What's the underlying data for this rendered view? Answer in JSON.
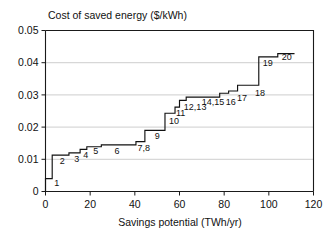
{
  "chart_data": {
    "type": "line",
    "subtype": "step-supply-curve",
    "title": "Cost of saved energy ($/kWh)",
    "xlabel": "Savings potential (TWh/yr)",
    "ylabel": "Cost of saved energy ($/kWh)",
    "xlim": [
      0,
      120
    ],
    "ylim": [
      0,
      0.05
    ],
    "xticks": [
      0,
      20,
      40,
      60,
      80,
      100,
      120
    ],
    "xtick_labels": [
      "0",
      "20",
      "40",
      "60",
      "80",
      "100",
      "120"
    ],
    "yticks": [
      0,
      0.01,
      0.02,
      0.03,
      0.04,
      0.05
    ],
    "ytick_labels": [
      "0",
      "0.01",
      "0.02",
      "0.03",
      "0.04",
      "0.05"
    ],
    "grid": "horizontal",
    "legend": "none",
    "note": "Cumulative step (supply) curve: each measure adds width on x and sits at its cost on y",
    "steps": [
      {
        "label": "1",
        "x_start": 0.0,
        "x_end": 3.0,
        "cost": 0.004
      },
      {
        "label": "2",
        "x_start": 3.0,
        "x_end": 10.5,
        "cost": 0.0113
      },
      {
        "label": "3",
        "x_start": 10.5,
        "x_end": 15.5,
        "cost": 0.012
      },
      {
        "label": "4",
        "x_start": 15.5,
        "x_end": 18.5,
        "cost": 0.0131
      },
      {
        "label": "5",
        "x_start": 18.5,
        "x_end": 25.0,
        "cost": 0.0139
      },
      {
        "label": "6",
        "x_start": 25.0,
        "x_end": 40.5,
        "cost": 0.0145
      },
      {
        "label": "7,8",
        "x_start": 40.5,
        "x_end": 44.5,
        "cost": 0.0155
      },
      {
        "label": "9",
        "x_start": 44.5,
        "x_end": 53.5,
        "cost": 0.019
      },
      {
        "label": "10",
        "x_start": 53.5,
        "x_end": 58.0,
        "cost": 0.0243
      },
      {
        "label": "11",
        "x_start": 58.0,
        "x_end": 60.0,
        "cost": 0.0262
      },
      {
        "label": "12,13",
        "x_start": 60.0,
        "x_end": 63.0,
        "cost": 0.0283
      },
      {
        "label": "14,15",
        "x_start": 63.0,
        "x_end": 78.0,
        "cost": 0.0293
      },
      {
        "label": "16",
        "x_start": 78.0,
        "x_end": 82.0,
        "cost": 0.0305
      },
      {
        "label": "17",
        "x_start": 82.0,
        "x_end": 86.0,
        "cost": 0.0312
      },
      {
        "label": "18",
        "x_start": 86.0,
        "x_end": 95.5,
        "cost": 0.033
      },
      {
        "label": "19",
        "x_start": 95.5,
        "x_end": 104.0,
        "cost": 0.0418
      },
      {
        "label": "20",
        "x_start": 104.0,
        "x_end": 111.5,
        "cost": 0.0428
      }
    ],
    "point_labels": [
      {
        "text": "1",
        "x": 5.0,
        "y": 0.0018
      },
      {
        "text": "2",
        "x": 7.5,
        "y": 0.0085
      },
      {
        "text": "3",
        "x": 14.0,
        "y": 0.0092
      },
      {
        "text": "4",
        "x": 18.0,
        "y": 0.0105
      },
      {
        "text": "5",
        "x": 22.5,
        "y": 0.0115
      },
      {
        "text": "6",
        "x": 32.0,
        "y": 0.0118
      },
      {
        "text": "7,8",
        "x": 44.0,
        "y": 0.0125
      },
      {
        "text": "9",
        "x": 50.0,
        "y": 0.0162
      },
      {
        "text": "10",
        "x": 57.5,
        "y": 0.021
      },
      {
        "text": "11",
        "x": 60.5,
        "y": 0.0236
      },
      {
        "text": "12,13",
        "x": 67.0,
        "y": 0.0253
      },
      {
        "text": "14,15",
        "x": 75.0,
        "y": 0.0268
      },
      {
        "text": "16",
        "x": 83.0,
        "y": 0.0268
      },
      {
        "text": "17",
        "x": 88.0,
        "y": 0.0281
      },
      {
        "text": "18",
        "x": 96.0,
        "y": 0.0297
      },
      {
        "text": "19",
        "x": 99.5,
        "y": 0.039
      },
      {
        "text": "20",
        "x": 108.0,
        "y": 0.0408
      }
    ]
  },
  "colors": {
    "ink": "#111111",
    "grid": "#b9b9b9",
    "background": "#ffffff"
  }
}
